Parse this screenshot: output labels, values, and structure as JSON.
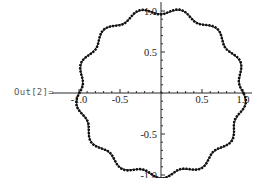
{
  "cell": {
    "out_label": "Out[2]=",
    "background_color": "#ffffff",
    "label_color": "#5a5a5a"
  },
  "chart_data": {
    "type": "line",
    "title": "",
    "subtitle": "",
    "xlabel": "",
    "ylabel": "",
    "xlim": [
      -1.15,
      1.15
    ],
    "ylim": [
      -1.15,
      1.15
    ],
    "grid": false,
    "legend": "none",
    "aspect_ratio": 1,
    "axes_style": "crossed-at-origin",
    "x_tick_labels": [
      "-1.0",
      "-0.5",
      "0.5",
      "1.0"
    ],
    "x_tick_values": [
      -1.0,
      -0.5,
      0.5,
      1.0
    ],
    "y_tick_labels": [
      "1.0",
      "0.5",
      "-0.5",
      "-1.0"
    ],
    "y_tick_values": [
      1.0,
      0.5,
      -0.5,
      -1.0
    ],
    "minor_ticks_per_interval": 4,
    "series": [
      {
        "name": "solid-curve",
        "style": "solid",
        "color": "#1a1a1a",
        "line_width": 1.0,
        "form": "polar",
        "base_radius": 1.0,
        "ripple_amplitude": 0.035,
        "ripple_lobes": 13,
        "phase_deg": 90
      },
      {
        "name": "dotted-curve",
        "style": "dotted",
        "color": "#111111",
        "line_width": 2.6,
        "form": "polar",
        "base_radius": 1.0,
        "ripple_amplitude": 0.042,
        "ripple_lobes": 13,
        "phase_deg": 82
      }
    ]
  }
}
